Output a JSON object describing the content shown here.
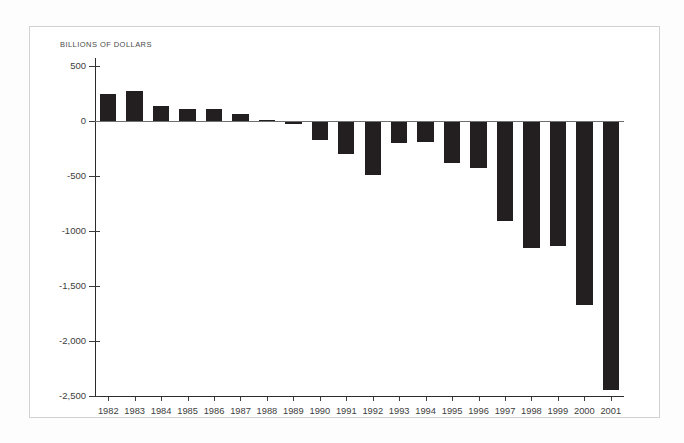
{
  "figure": {
    "axis_units_label": "BILLIONS OF DOLLARS",
    "bar_color": "#231f20",
    "axis_color": "#2b2b2b",
    "text_color": "#3d3d3d",
    "frame_color": "#d2d2d2",
    "background": "#ffffff"
  },
  "chart_data": {
    "type": "bar",
    "title": "",
    "subtitle": "",
    "xlabel": "",
    "ylabel": "BILLIONS OF DOLLARS",
    "ylim": [
      -2500,
      500
    ],
    "yticks": [
      500,
      0,
      -500,
      -1000,
      -1500,
      -2000,
      -2500
    ],
    "ytick_labels": [
      "500",
      "0",
      "-500",
      "-1000",
      "-1,500",
      "-2,000",
      "-2,500"
    ],
    "grid": false,
    "legend": null,
    "categories": [
      "1982",
      "1983",
      "1984",
      "1985",
      "1986",
      "1987",
      "1988",
      "1989",
      "1990",
      "1991",
      "1992",
      "1993",
      "1994",
      "1995",
      "1996",
      "1997",
      "1998",
      "1999",
      "2000",
      "2001"
    ],
    "values": [
      245,
      275,
      140,
      105,
      105,
      60,
      8,
      -30,
      -170,
      -300,
      -490,
      -200,
      -190,
      -385,
      -425,
      -905,
      -1155,
      -1140,
      -1675,
      -2445
    ]
  }
}
